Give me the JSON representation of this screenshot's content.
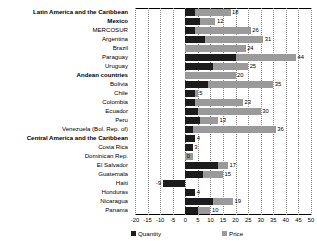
{
  "chart_data": {
    "type": "bar",
    "orientation": "horizontal",
    "stacked": true,
    "title": "",
    "xlabel": "",
    "ylabel": "",
    "xlim": [
      -20,
      50
    ],
    "xticks": [
      "-20",
      "-15",
      "-10",
      "-5",
      "0",
      "5",
      "10",
      "15",
      "20",
      "25",
      "30",
      "35",
      "40",
      "45",
      "50"
    ],
    "grid": true,
    "legend_position": "bottom",
    "legend": [
      "Quantity",
      "Price"
    ],
    "colors": {
      "quantity": "#1c1c1c",
      "price": "#9a9a9a",
      "gridline": "#8d8d8d",
      "axis": "#000000"
    },
    "categories": [
      "Latin America and the Caribbean",
      "Mexico",
      "MERCOSUR",
      "Argentina",
      "Brazil",
      "Paraguay",
      "Uruguay",
      "Andean countries",
      "Bolivia",
      "Chile",
      "Colombia",
      "Ecuador",
      "Peru",
      "Venezuela (Bol. Rep. of)",
      "Central America and the Caribbean",
      "Costa Rica",
      "Dominican Rep.",
      "El Salvador",
      "Guatemala",
      "Haiti",
      "Honduras",
      "Nicaragua",
      "Panama"
    ],
    "bold_categories": [
      "Latin America and the Caribbean",
      "Mexico",
      "Andean countries",
      "Central America and the Caribbean"
    ],
    "series": [
      {
        "name": "Quantity",
        "values": [
          4,
          6,
          4,
          8,
          0,
          20,
          11,
          0,
          9,
          4,
          4,
          5,
          6,
          3,
          4,
          3,
          3,
          13,
          7,
          -9,
          4,
          11,
          5
        ]
      },
      {
        "name": "Price",
        "values": [
          14,
          6,
          22,
          23,
          24,
          24,
          14,
          20,
          26,
          1,
          19,
          25,
          7,
          33,
          0,
          0,
          -3,
          4,
          8,
          0,
          0,
          8,
          5
        ]
      }
    ],
    "totals": [
      18,
      12,
      26,
      31,
      24,
      44,
      25,
      20,
      35,
      5,
      23,
      30,
      13,
      36,
      4,
      3,
      0,
      17,
      15,
      -9,
      4,
      19,
      10
    ],
    "total_labels": [
      "18",
      "12",
      "26",
      "31",
      "24",
      "44",
      "25",
      "20",
      "35",
      "5",
      "23",
      "30",
      "13",
      "36",
      "4",
      "3",
      "0",
      "17",
      "15",
      "-9",
      "4",
      "19",
      "10"
    ]
  }
}
